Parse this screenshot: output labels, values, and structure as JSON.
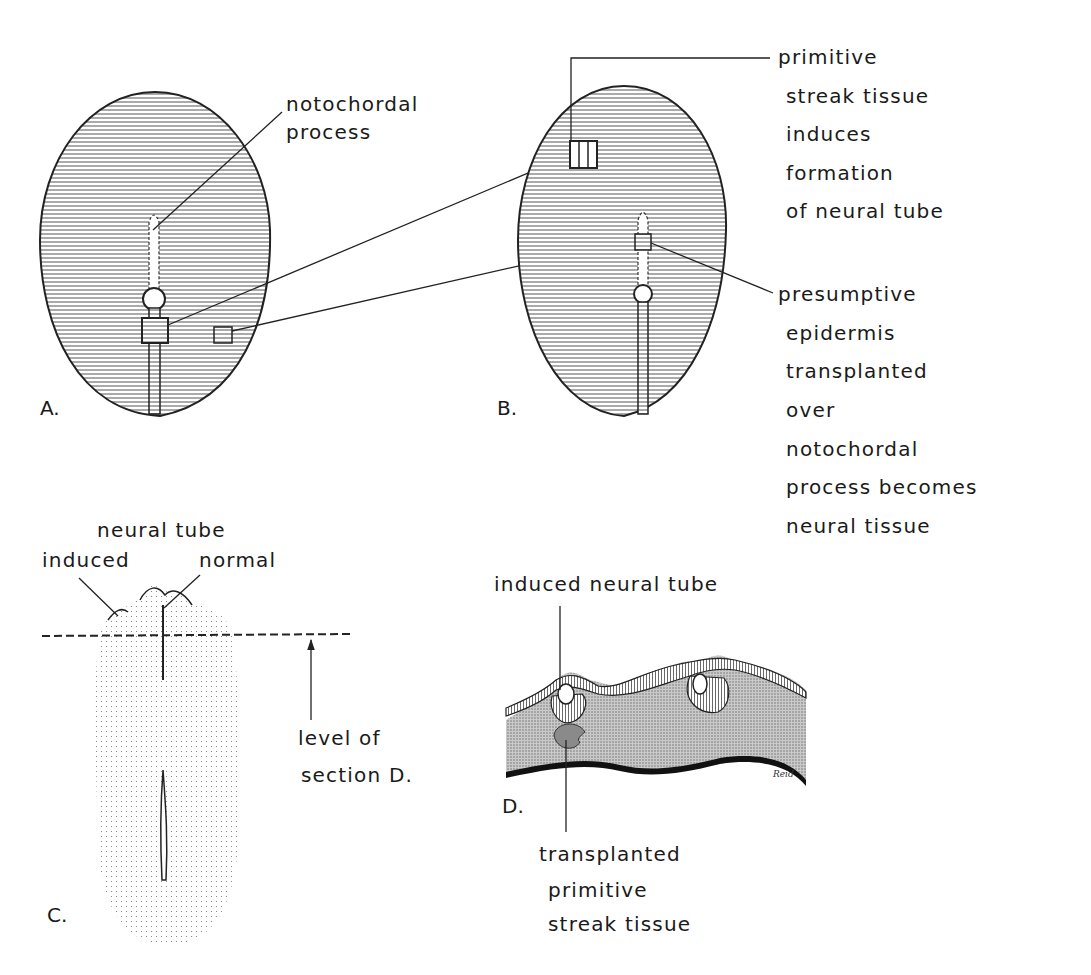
{
  "figure": {
    "panels": {
      "A": {
        "label": "A.",
        "annotation": "notochordal process"
      },
      "B": {
        "label": "B.",
        "annotation_top": [
          "primitive",
          "streak tissue",
          "induces",
          "formation",
          "of neural tube"
        ],
        "annotation_bottom": [
          "presumptive",
          "epidermis",
          "transplanted",
          "over",
          "notochordal",
          "process becomes",
          "neural tissue"
        ]
      },
      "C": {
        "label": "C.",
        "header": "neural tube",
        "left": "induced",
        "right": "normal",
        "level": [
          "level of",
          "section D."
        ]
      },
      "D": {
        "label": "D.",
        "top": "induced neural tube",
        "bottom": [
          "transplanted",
          "primitive",
          "streak tissue"
        ],
        "signature": "Reid"
      }
    }
  }
}
